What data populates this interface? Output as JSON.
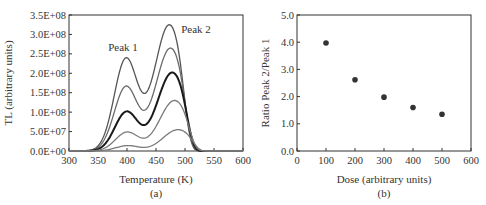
{
  "chart_data": [
    {
      "type": "line",
      "panel_label": "(a)",
      "title": "",
      "xlabel": "Temperature (K)",
      "ylabel": "TL (arbitrary units)",
      "xlim": [
        300,
        600
      ],
      "ylim": [
        0,
        350000000
      ],
      "x_ticks": [
        "300",
        "350",
        "400",
        "450",
        "500",
        "550",
        "600"
      ],
      "y_ticks": [
        "0.0E+00",
        "5.0E+07",
        "1.0E+08",
        "1.5E+08",
        "2.0E+08",
        "2.5E+08",
        "3.0E+08",
        "3.5E+08"
      ],
      "grid": false,
      "annotations": [
        "Peak 1",
        "Peak 2"
      ],
      "series": [
        {
          "name": "curve 1",
          "peak1": {
            "x": 398,
            "y": 240000000
          },
          "valley": {
            "x": 430,
            "y": 62000000
          },
          "peak2": {
            "x": 473,
            "y": 325000000
          }
        },
        {
          "name": "curve 2",
          "peak1": {
            "x": 398,
            "y": 167000000
          },
          "valley": {
            "x": 430,
            "y": 45000000
          },
          "peak2": {
            "x": 475,
            "y": 265000000
          }
        },
        {
          "name": "curve 3",
          "peak1": {
            "x": 399,
            "y": 102000000
          },
          "valley": {
            "x": 430,
            "y": 28000000
          },
          "peak2": {
            "x": 478,
            "y": 202000000
          }
        },
        {
          "name": "curve 4",
          "peak1": {
            "x": 400,
            "y": 49000000
          },
          "valley": {
            "x": 430,
            "y": 15000000
          },
          "peak2": {
            "x": 482,
            "y": 130000000
          }
        },
        {
          "name": "curve 5",
          "peak1": {
            "x": 401,
            "y": 14000000
          },
          "valley": {
            "x": 428,
            "y": 6000000
          },
          "peak2": {
            "x": 488,
            "y": 55000000
          }
        }
      ]
    },
    {
      "type": "scatter",
      "panel_label": "(b)",
      "title": "",
      "xlabel": "Dose (arbitrary units)",
      "ylabel": "Ratio Peak 2/Peak 1",
      "xlim": [
        0,
        600
      ],
      "ylim": [
        0,
        5
      ],
      "x_ticks": [
        "0",
        "100",
        "200",
        "300",
        "400",
        "500",
        "600"
      ],
      "y_ticks": [
        "0.0",
        "1.0",
        "2.0",
        "3.0",
        "4.0",
        "5.0"
      ],
      "grid": false,
      "x": [
        100,
        200,
        300,
        400,
        500
      ],
      "values": [
        3.97,
        2.62,
        1.98,
        1.6,
        1.35
      ]
    }
  ],
  "labels": {
    "a_xlabel": "Temperature (K)",
    "a_ylabel": "TL (arbitrary units)",
    "a_panel": "(a)",
    "peak1": "Peak 1",
    "peak2": "Peak 2",
    "b_xlabel": "Dose (arbitrary units)",
    "b_ylabel": "Ratio Peak 2/Peak 1",
    "b_panel": "(b)"
  },
  "colors": {
    "frame": "#333333",
    "curves": [
      "#555555",
      "#6a6a6a",
      "#1a1a1a",
      "#7a7a7a",
      "#7a7a7a"
    ],
    "markers": "#333333"
  }
}
